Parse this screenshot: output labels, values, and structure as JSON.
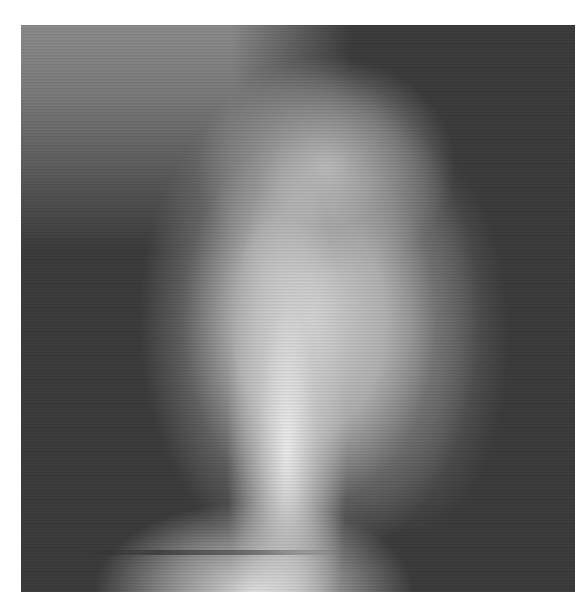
{
  "image": {
    "description": "Grayscale scanning-probe micrograph showing a bright elongated feature on a dark background",
    "colormap": "grayscale",
    "colors": {
      "background": "#3a3a3a",
      "highlight": "#f0f0f0",
      "page": "#ffffff"
    }
  }
}
